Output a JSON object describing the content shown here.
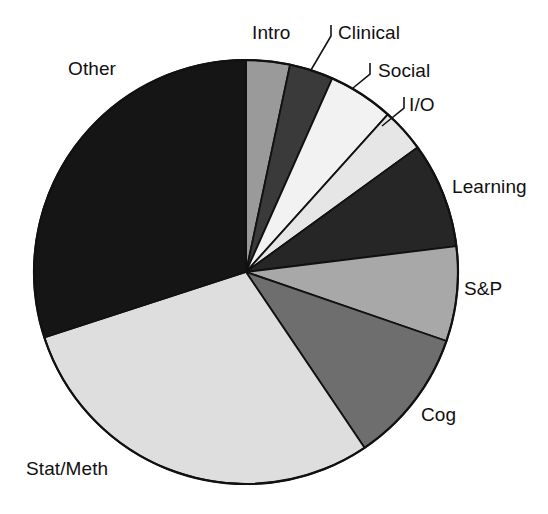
{
  "chart_data": {
    "type": "pie",
    "title": "",
    "subtitle": "",
    "xlabel": "",
    "ylabel": "",
    "legend_position": "none",
    "grid": false,
    "labels_outside": true,
    "start_angle_deg": 0,
    "direction": "clockwise",
    "categories": [
      "Intro",
      "Clinical",
      "Social",
      "I/O",
      "Learning",
      "S&P",
      "Cog",
      "Stat/Meth",
      "Other"
    ],
    "values": [
      3.3,
      3.3,
      5.0,
      3.3,
      8.1,
      7.2,
      10.3,
      29.5,
      30.0
    ],
    "slices": [
      {
        "label": "Intro",
        "value": 3.3,
        "start_deg": 0.0,
        "end_deg": 12.0,
        "fill": "#9a9a9a",
        "stroke": "#111111",
        "has_leader": false
      },
      {
        "label": "Clinical",
        "value": 3.3,
        "start_deg": 12.0,
        "end_deg": 24.0,
        "fill": "#3a3a3a",
        "stroke": "#111111",
        "has_leader": true
      },
      {
        "label": "Social",
        "value": 5.0,
        "start_deg": 24.0,
        "end_deg": 42.0,
        "fill": "#f2f2f2",
        "stroke": "#111111",
        "has_leader": true
      },
      {
        "label": "I/O",
        "value": 3.3,
        "start_deg": 42.0,
        "end_deg": 54.0,
        "fill": "#e6e6e6",
        "stroke": "#111111",
        "has_leader": true
      },
      {
        "label": "Learning",
        "value": 8.1,
        "start_deg": 54.0,
        "end_deg": 83.0,
        "fill": "#262626",
        "stroke": "#111111",
        "has_leader": false
      },
      {
        "label": "S&P",
        "value": 7.2,
        "start_deg": 83.0,
        "end_deg": 109.0,
        "fill": "#a8a8a8",
        "stroke": "#111111",
        "has_leader": false
      },
      {
        "label": "Cog",
        "value": 10.3,
        "start_deg": 109.0,
        "end_deg": 146.0,
        "fill": "#6e6e6e",
        "stroke": "#111111",
        "has_leader": false
      },
      {
        "label": "Stat/Meth",
        "value": 29.5,
        "start_deg": 146.0,
        "end_deg": 252.0,
        "fill": "#dedede",
        "stroke": "#111111",
        "has_leader": false
      },
      {
        "label": "Other",
        "value": 30.0,
        "start_deg": 252.0,
        "end_deg": 360.0,
        "fill": "#151515",
        "stroke": "#111111",
        "has_leader": false
      }
    ],
    "geometry": {
      "center_x": 246,
      "center_y": 272,
      "radius": 212
    },
    "label_positions": [
      {
        "label": "Intro",
        "x": 252,
        "y": 22,
        "anchor": "middle"
      },
      {
        "label": "Clinical",
        "x": 338,
        "y": 22,
        "anchor": "start"
      },
      {
        "label": "Social",
        "x": 378,
        "y": 60,
        "anchor": "start"
      },
      {
        "label": "I/O",
        "x": 409,
        "y": 94,
        "anchor": "start"
      },
      {
        "label": "Learning",
        "x": 452,
        "y": 176,
        "anchor": "start"
      },
      {
        "label": "S&P",
        "x": 464,
        "y": 278,
        "anchor": "start"
      },
      {
        "label": "Cog",
        "x": 421,
        "y": 404,
        "anchor": "start"
      },
      {
        "label": "Stat/Meth",
        "x": 26,
        "y": 458,
        "anchor": "start"
      },
      {
        "label": "Other",
        "x": 68,
        "y": 58,
        "anchor": "start"
      }
    ],
    "leader_lines": [
      {
        "label": "Clinical",
        "points": "331,25 331,36 311,70"
      },
      {
        "label": "Social",
        "points": "370,63 370,74 353,88"
      },
      {
        "label": "I/O",
        "points": "404,97 404,108 382,126"
      }
    ]
  }
}
